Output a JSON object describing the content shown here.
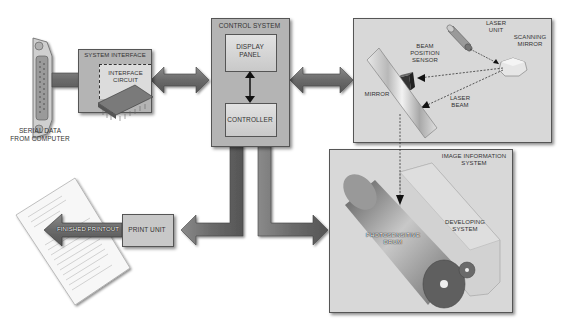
{
  "diagram": {
    "nodes": {
      "serial_data": {
        "label_line1": "SERIAL DATA",
        "label_line2": "FROM COMPUTER"
      },
      "system_interface": {
        "label": "SYSTEM INTERFACE"
      },
      "interface_circuit": {
        "label_line1": "INTERFACE",
        "label_line2": "CIRCUIT"
      },
      "control_system": {
        "label": "CONTROL SYSTEM"
      },
      "display_panel": {
        "label_line1": "DISPLAY",
        "label_line2": "PANEL"
      },
      "controller": {
        "label": "CONTROLLER"
      },
      "laser_unit": {
        "label_line1": "LASER",
        "label_line2": "UNIT"
      },
      "scanning_mirror": {
        "label_line1": "SCANNING",
        "label_line2": "MIRROR"
      },
      "beam_position_sensor": {
        "label_line1": "BEAM",
        "label_line2": "POSITION",
        "label_line3": "SENSOR"
      },
      "mirror": {
        "label": "MIRROR"
      },
      "laser_beam": {
        "label_line1": "LASER",
        "label_line2": "BEAM"
      },
      "image_information_system": {
        "label_line1": "IMAGE INFORMATION",
        "label_line2": "SYSTEM"
      },
      "photosensitive_drum": {
        "label_line1": "PHOTOSENSITIVE",
        "label_line2": "DRUM"
      },
      "developing_system": {
        "label_line1": "DEVELOPING",
        "label_line2": "SYSTEM"
      },
      "print_unit": {
        "label": "PRINT UNIT"
      },
      "finished_printout": {
        "label": "FINISHED PRINTOUT"
      }
    },
    "colors": {
      "arrow_fill": "#6e6e6e",
      "box_light": "#d8d8d8",
      "box_mid": "#b4b4b4",
      "border": "#555555"
    }
  }
}
